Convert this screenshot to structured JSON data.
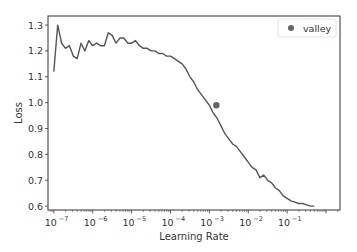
{
  "chart_data": {
    "type": "line",
    "title": "",
    "xlabel": "Learning Rate",
    "ylabel": "Loss",
    "xscale": "log",
    "xlim_exp": [
      -7.15,
      0.36
    ],
    "ylim": [
      0.585,
      1.335
    ],
    "xticks": [
      {
        "exp": -7,
        "label": "10",
        "sup": "−7"
      },
      {
        "exp": -6,
        "label": "10",
        "sup": "−6"
      },
      {
        "exp": -5,
        "label": "10",
        "sup": "−5"
      },
      {
        "exp": -4,
        "label": "10",
        "sup": "−4"
      },
      {
        "exp": -3,
        "label": "10",
        "sup": "−3"
      },
      {
        "exp": -2,
        "label": "10",
        "sup": "−2"
      },
      {
        "exp": -1,
        "label": "10",
        "sup": "−1"
      }
    ],
    "yticks": [
      0.6,
      0.7,
      0.8,
      0.9,
      1.0,
      1.1,
      1.2,
      1.3
    ],
    "grid": false,
    "legend": {
      "position": "upper right",
      "entries": [
        {
          "label": "valley",
          "marker": "circle"
        }
      ]
    },
    "series": [
      {
        "name": "loss",
        "color": "#555555",
        "x_exp": [
          -7.0,
          -6.9,
          -6.8,
          -6.7,
          -6.6,
          -6.5,
          -6.4,
          -6.3,
          -6.2,
          -6.1,
          -6.0,
          -5.9,
          -5.8,
          -5.7,
          -5.6,
          -5.5,
          -5.4,
          -5.3,
          -5.2,
          -5.1,
          -5.0,
          -4.9,
          -4.8,
          -4.7,
          -4.6,
          -4.5,
          -4.4,
          -4.3,
          -4.2,
          -4.1,
          -4.0,
          -3.9,
          -3.8,
          -3.7,
          -3.6,
          -3.5,
          -3.4,
          -3.3,
          -3.2,
          -3.1,
          -3.0,
          -2.9,
          -2.8,
          -2.7,
          -2.6,
          -2.5,
          -2.4,
          -2.3,
          -2.2,
          -2.1,
          -2.0,
          -1.9,
          -1.8,
          -1.7,
          -1.6,
          -1.5,
          -1.4,
          -1.3,
          -1.2,
          -1.1,
          -1.0,
          -0.9,
          -0.8,
          -0.7,
          -0.6,
          -0.5,
          -0.4,
          -0.3
        ],
        "y": [
          1.12,
          1.3,
          1.23,
          1.21,
          1.22,
          1.18,
          1.17,
          1.23,
          1.2,
          1.24,
          1.22,
          1.23,
          1.22,
          1.22,
          1.27,
          1.26,
          1.23,
          1.25,
          1.25,
          1.23,
          1.23,
          1.24,
          1.22,
          1.21,
          1.21,
          1.2,
          1.2,
          1.19,
          1.19,
          1.18,
          1.18,
          1.17,
          1.16,
          1.15,
          1.13,
          1.1,
          1.08,
          1.05,
          1.03,
          1.01,
          0.99,
          0.96,
          0.94,
          0.91,
          0.88,
          0.86,
          0.84,
          0.83,
          0.81,
          0.79,
          0.77,
          0.75,
          0.74,
          0.71,
          0.72,
          0.7,
          0.69,
          0.67,
          0.66,
          0.64,
          0.63,
          0.62,
          0.615,
          0.61,
          0.61,
          0.605,
          0.6,
          0.6
        ]
      }
    ],
    "valley": {
      "x_exp": -2.82,
      "y": 0.99,
      "color": "#666666"
    }
  },
  "legend": {
    "label": "valley"
  },
  "axes": {
    "xlabel": "Learning Rate",
    "ylabel": "Loss"
  }
}
